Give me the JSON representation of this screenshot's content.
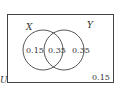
{
  "diagram": {
    "type": "venn",
    "universe_label": "U",
    "sets": [
      {
        "label": "X"
      },
      {
        "label": "Y"
      }
    ],
    "regions": {
      "x_only": "0.15",
      "intersection": "0.35",
      "y_only": "0.35",
      "outside": "0.15"
    },
    "stroke_color": "#444444"
  }
}
